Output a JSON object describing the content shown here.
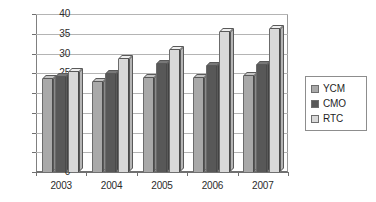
{
  "chart_data": {
    "type": "bar",
    "title": "",
    "xlabel": "",
    "ylabel": "",
    "categories": [
      "2003",
      "2004",
      "2005",
      "2006",
      "2007"
    ],
    "ylim": [
      0,
      40
    ],
    "yticks": [
      "0",
      "5",
      "10",
      "15",
      "20",
      "25",
      "30",
      "35",
      "40"
    ],
    "grid": true,
    "legend_position": "right",
    "style": "3d-clustered-column",
    "series": [
      {
        "name": "YCM",
        "color": "#a9a9a9",
        "values": [
          23.5,
          22.7,
          23.8,
          23.9,
          24.2
        ]
      },
      {
        "name": "CMO",
        "color": "#585858",
        "values": [
          24.0,
          24.8,
          27.3,
          26.8,
          27.1
        ]
      },
      {
        "name": "RTC",
        "color": "#d9d9d9",
        "values": [
          25.2,
          28.5,
          31.0,
          35.5,
          36.2
        ]
      }
    ]
  },
  "legend": {
    "items": [
      {
        "label": "YCM",
        "swatch": "#a9a9a9"
      },
      {
        "label": "CMO",
        "swatch": "#585858"
      },
      {
        "label": "RTC",
        "swatch": "#d9d9d9"
      }
    ]
  }
}
